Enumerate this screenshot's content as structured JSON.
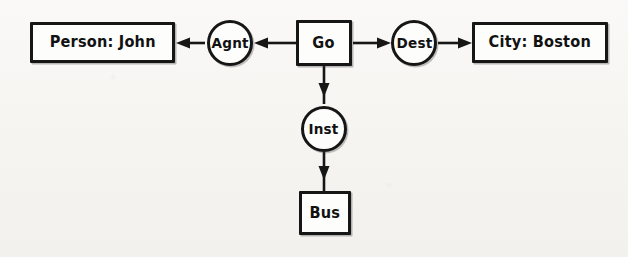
{
  "diagram": {
    "background_color": "#f5f4f1",
    "ink_color": "#161616",
    "nodes": [
      {
        "id": "person",
        "type": "concept",
        "label": "Person: John",
        "shape": "rectangle",
        "x": 30,
        "y": 22,
        "w": 145,
        "h": 41
      },
      {
        "id": "agnt",
        "type": "relation",
        "label": "Agnt",
        "shape": "circle",
        "x": 207,
        "y": 20,
        "w": 46,
        "h": 46
      },
      {
        "id": "go",
        "type": "concept",
        "label": "Go",
        "shape": "rectangle",
        "x": 296,
        "y": 20,
        "w": 56,
        "h": 46
      },
      {
        "id": "dest",
        "type": "relation",
        "label": "Dest",
        "shape": "circle",
        "x": 391,
        "y": 20,
        "w": 46,
        "h": 46
      },
      {
        "id": "city",
        "type": "concept",
        "label": "City: Boston",
        "shape": "rectangle",
        "x": 472,
        "y": 22,
        "w": 136,
        "h": 41
      },
      {
        "id": "inst",
        "type": "relation",
        "label": "Inst",
        "shape": "circle",
        "x": 301,
        "y": 106,
        "w": 46,
        "h": 46
      },
      {
        "id": "bus",
        "type": "concept",
        "label": "Bus",
        "shape": "rectangle",
        "x": 299,
        "y": 191,
        "w": 52,
        "h": 44
      }
    ],
    "edges": [
      {
        "id": "go-agnt",
        "from": "go",
        "to": "agnt",
        "direction": "left",
        "x1": 296,
        "y1": 43,
        "x2": 255,
        "y2": 43
      },
      {
        "id": "agnt-person",
        "from": "agnt",
        "to": "person",
        "direction": "left",
        "x1": 205,
        "y1": 43,
        "x2": 176,
        "y2": 43
      },
      {
        "id": "go-dest",
        "from": "go",
        "to": "dest",
        "direction": "right",
        "x1": 353,
        "y1": 43,
        "x2": 390,
        "y2": 43
      },
      {
        "id": "dest-city",
        "from": "dest",
        "to": "city",
        "direction": "right",
        "x1": 438,
        "y1": 43,
        "x2": 471,
        "y2": 43
      },
      {
        "id": "go-inst",
        "from": "go",
        "to": "inst",
        "direction": "down",
        "x1": 324,
        "y1": 66,
        "x2": 324,
        "y2": 105
      },
      {
        "id": "inst-bus",
        "from": "inst",
        "to": "bus",
        "direction": "down",
        "x1": 324,
        "y1": 152,
        "x2": 324,
        "y2": 190
      }
    ]
  }
}
